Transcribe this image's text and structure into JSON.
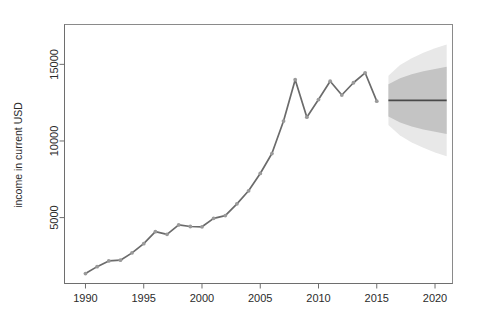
{
  "chart_data": {
    "type": "line",
    "title": "",
    "xlabel": "",
    "ylabel": "income in current USD",
    "xlim": [
      1988.2,
      2021.5
    ],
    "ylim": [
      700,
      17600
    ],
    "grid": false,
    "legend": null,
    "xticks": [
      1990,
      1995,
      2000,
      2005,
      2010,
      2015,
      2020
    ],
    "xtick_labels": [
      "1990",
      "1995",
      "2000",
      "2005",
      "2010",
      "2015",
      "2020"
    ],
    "yticks": [
      5000,
      10000,
      15000
    ],
    "ytick_labels": [
      "5000",
      "10000",
      "15000"
    ],
    "series": [
      {
        "name": "observed",
        "type": "line-with-points",
        "color": "#6b6b6b",
        "point_color": "#9a9a9a",
        "x": [
          1990,
          1991,
          1992,
          1993,
          1994,
          1995,
          1996,
          1997,
          1998,
          1999,
          2000,
          2001,
          2002,
          2003,
          2004,
          2005,
          2006,
          2007,
          2008,
          2009,
          2010,
          2011,
          2012,
          2013,
          2014,
          2015
        ],
        "values": [
          1350,
          1800,
          2170,
          2220,
          2700,
          3300,
          4080,
          3910,
          4520,
          4420,
          4400,
          4950,
          5130,
          5900,
          6750,
          7880,
          9180,
          11300,
          14000,
          11550,
          12700,
          13900,
          13000,
          13800,
          14450,
          12600
        ]
      },
      {
        "name": "forecast mean",
        "type": "line",
        "color": "#4a4a4a",
        "x": [
          2016,
          2017,
          2018,
          2019,
          2020,
          2021
        ],
        "values": [
          12650,
          12650,
          12650,
          12650,
          12650,
          12650
        ]
      }
    ],
    "intervals": [
      {
        "name": "80% prediction interval",
        "level": 80,
        "color": "#bfbfbf",
        "x": [
          2016,
          2017,
          2018,
          2019,
          2020,
          2021
        ],
        "lower": [
          11600,
          11200,
          10950,
          10750,
          10600,
          10450
        ],
        "upper": [
          13700,
          14100,
          14350,
          14550,
          14700,
          14850
        ]
      },
      {
        "name": "95% prediction interval",
        "level": 95,
        "color": "#e6e6e6",
        "x": [
          2016,
          2017,
          2018,
          2019,
          2020,
          2021
        ],
        "lower": [
          11050,
          10350,
          9900,
          9550,
          9250,
          9000
        ],
        "upper": [
          14250,
          14950,
          15400,
          15750,
          16050,
          16300
        ]
      }
    ]
  },
  "axis": {
    "y_title": "income in current USD",
    "y_labels": [
      "5000",
      "10000",
      "15000"
    ],
    "x_labels": [
      "1990",
      "1995",
      "2000",
      "2005",
      "2010",
      "2015",
      "2020"
    ]
  },
  "header": {
    "title": ""
  },
  "colors": {
    "line": "#6b6b6b",
    "point": "#9a9a9a",
    "band_inner": "#bfbfbf",
    "band_outer": "#e6e6e6",
    "axis": "#6e6e6e",
    "text": "#2b2b2b"
  }
}
